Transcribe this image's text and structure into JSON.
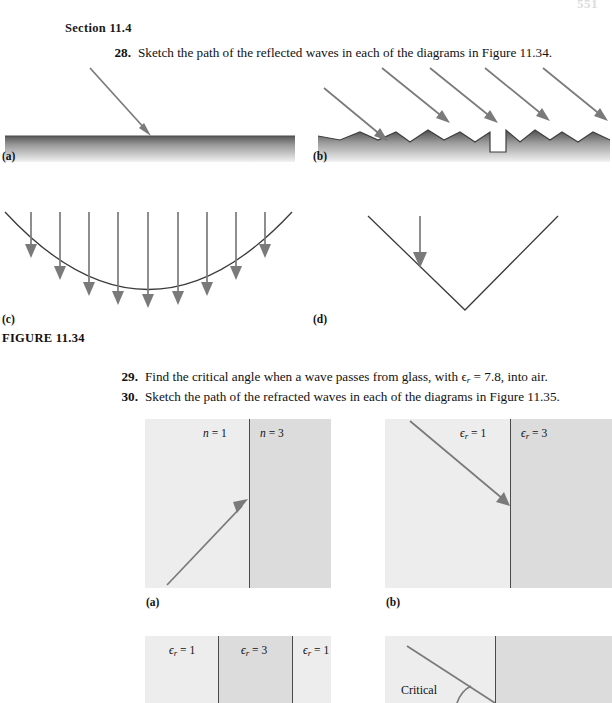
{
  "page": {
    "page_number": "551"
  },
  "section": {
    "heading": "Section 11.4"
  },
  "problems": [
    {
      "number": "28.",
      "text": "Sketch the path of the reflected waves in each of the diagrams in Figure 11.34."
    },
    {
      "number": "29.",
      "text_before": "Find the critical angle when a wave passes from glass, with ",
      "symbol": "ϵ",
      "subscript": "r",
      "text_after": " = 7.8, into air."
    },
    {
      "number": "30.",
      "text": "Sketch the path of the refracted waves in each of the diagrams in Figure 11.35."
    }
  ],
  "figure_1134": {
    "caption": "FIGURE 11.34",
    "panels": [
      {
        "label": "(a)",
        "description": "flat smooth surface with one incident ray at oblique angle"
      },
      {
        "label": "(b)",
        "description": "rough jagged surface with five parallel incident rays"
      },
      {
        "label": "(c)",
        "description": "concave parabolic surface with nine vertical incident rays"
      },
      {
        "label": "(d)",
        "description": "V-shaped corner reflector with one vertical incident ray"
      }
    ]
  },
  "figure_1135": {
    "panels": [
      {
        "label": "(a)",
        "media": [
          {
            "symbol": "n",
            "value": "1",
            "shade": "light"
          },
          {
            "symbol": "n",
            "value": "3",
            "shade": "dark"
          }
        ],
        "ray": "upward-right incident ray striking interface"
      },
      {
        "label": "(b)",
        "media": [
          {
            "symbol": "ϵ",
            "subscript": "r",
            "value": "1",
            "shade": "light"
          },
          {
            "symbol": "ϵ",
            "subscript": "r",
            "value": "3",
            "shade": "dark"
          }
        ],
        "ray": "downward-right incident ray striking interface"
      },
      {
        "label": "(c)",
        "media": [
          {
            "symbol": "ϵ",
            "subscript": "r",
            "value": "1",
            "shade": "light"
          },
          {
            "symbol": "ϵ",
            "subscript": "r",
            "value": "3",
            "shade": "dark"
          },
          {
            "symbol": "ϵ",
            "subscript": "r",
            "value": "1",
            "shade": "light"
          }
        ],
        "ray": "none shown"
      },
      {
        "label": "(d)",
        "annotation": "Critical",
        "ray": "downward-right ray with critical angle marker at interface"
      }
    ]
  },
  "colors": {
    "ray": "#7a7a7a",
    "outline": "#3a3a3a",
    "surface_dark": "#4a4a4a",
    "region_light": "#ededed",
    "region_dark": "#dcdcdc",
    "text": "#111111",
    "page_number": "#dcdcdc"
  }
}
